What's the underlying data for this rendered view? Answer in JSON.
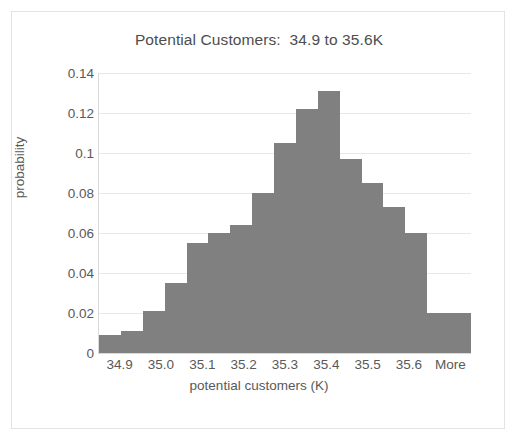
{
  "chart_data": {
    "type": "bar",
    "title": "Potential Customers:  34.9 to 35.6K",
    "xlabel": "potential customers (K)",
    "ylabel": "probability",
    "ylim": [
      0,
      0.14
    ],
    "yticks": [
      "0",
      "0.02",
      "0.04",
      "0.06",
      "0.08",
      "0.1",
      "0.12",
      "0.14"
    ],
    "ytick_values": [
      0,
      0.02,
      0.04,
      0.06,
      0.08,
      0.1,
      0.12,
      0.14
    ],
    "xticks": [
      "34.9",
      "35.0",
      "35.1",
      "35.2",
      "35.3",
      "35.4",
      "35.5",
      "35.6",
      "More"
    ],
    "grid": true,
    "legend": false,
    "bar_color": "#808080",
    "categories": [
      "34.9",
      "34.95",
      "35.0",
      "35.05",
      "35.1",
      "35.15",
      "35.2",
      "35.25",
      "35.3",
      "35.35",
      "35.4",
      "35.45",
      "35.5",
      "35.55",
      "35.6",
      "35.65",
      "More"
    ],
    "values": [
      0.009,
      0.011,
      0.021,
      0.035,
      0.055,
      0.06,
      0.064,
      0.08,
      0.105,
      0.122,
      0.131,
      0.097,
      0.085,
      0.073,
      0.06,
      0.02,
      0.02
    ]
  },
  "chart_frame": {
    "background": "#ffffff",
    "border_color": "#e3e3e3"
  }
}
